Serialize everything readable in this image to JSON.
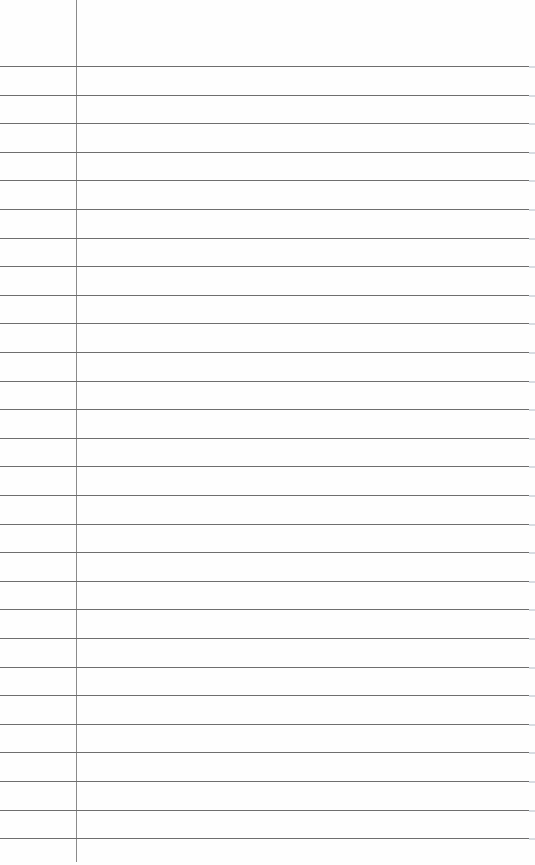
{
  "document": {
    "type": "lined-notebook-paper",
    "ruled_line_count": 28,
    "first_line_y": 66,
    "line_spacing": 28.6,
    "margin_line_x": 76,
    "colors": {
      "paper": "#fefefe",
      "rule": "#6e6e6e",
      "margin": "#8a8a8a"
    },
    "text": ""
  }
}
